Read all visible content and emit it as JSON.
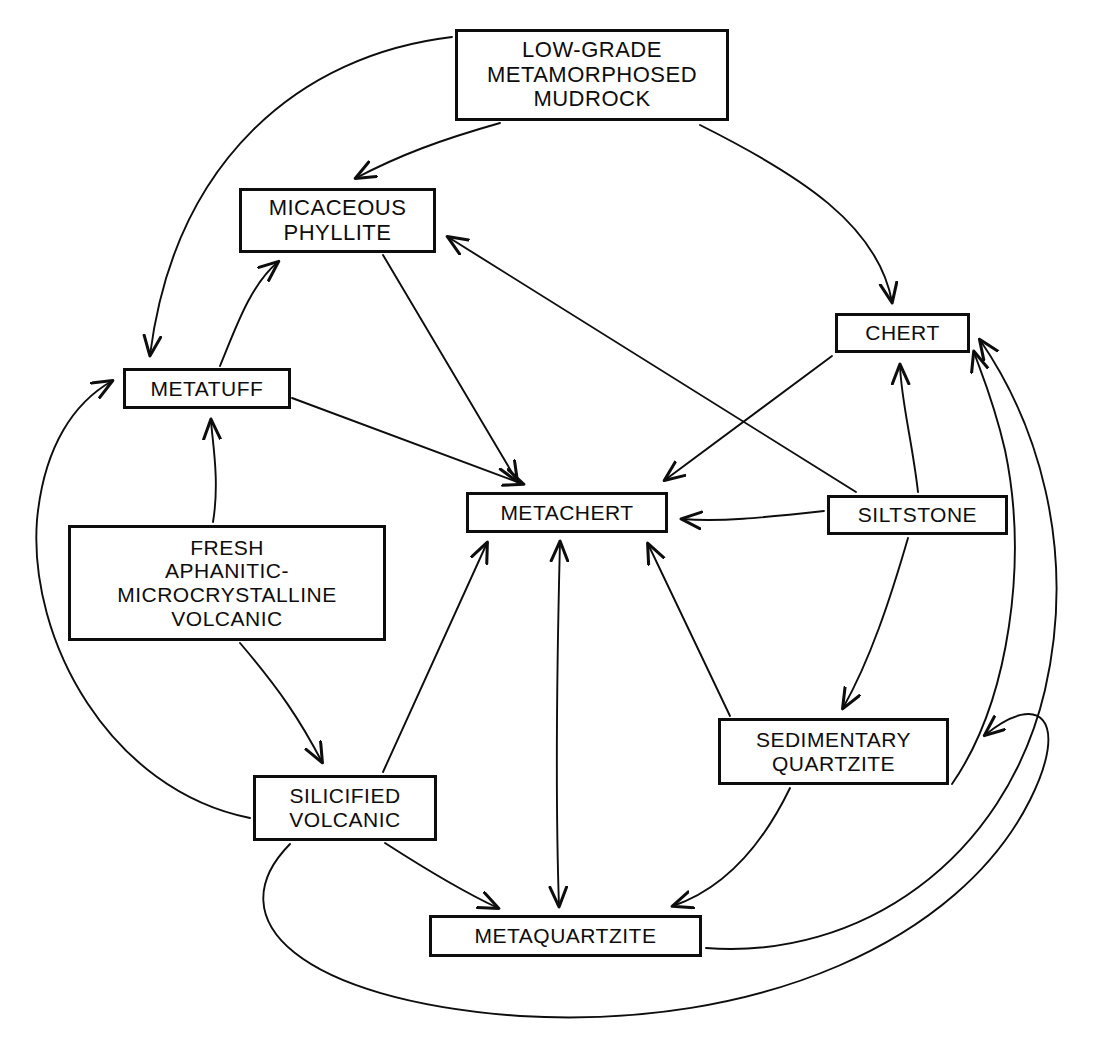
{
  "diagram": {
    "background_color": "#ffffff",
    "line_color": "#0d0d0d",
    "nodes": [
      {
        "id": "low_grade",
        "label": "LOW-GRADE\nMETAMORPHOSED\nMUDROCK",
        "x": 455,
        "y": 29,
        "w": 274,
        "h": 92
      },
      {
        "id": "micaceous",
        "label": "MICACEOUS\nPHYLLITE",
        "x": 239,
        "y": 188,
        "w": 197,
        "h": 65
      },
      {
        "id": "chert",
        "label": "CHERT",
        "x": 835,
        "y": 313,
        "w": 135,
        "h": 40
      },
      {
        "id": "metatuff",
        "label": "METATUFF",
        "x": 123,
        "y": 368,
        "w": 168,
        "h": 41
      },
      {
        "id": "metachert",
        "label": "METACHERT",
        "x": 466,
        "y": 492,
        "w": 202,
        "h": 41
      },
      {
        "id": "siltstone",
        "label": "SILTSTONE",
        "x": 827,
        "y": 495,
        "w": 181,
        "h": 40
      },
      {
        "id": "fresh",
        "label": "FRESH\nAPHANITIC-\nMICROCRYSTALLINE\nVOLCANIC",
        "x": 68,
        "y": 525,
        "w": 318,
        "h": 116
      },
      {
        "id": "sed_qtz",
        "label": "SEDIMENTARY\nQUARTZITE",
        "x": 718,
        "y": 718,
        "w": 231,
        "h": 67
      },
      {
        "id": "silicified",
        "label": "SILICIFIED\nVOLCANIC",
        "x": 253,
        "y": 775,
        "w": 184,
        "h": 66
      },
      {
        "id": "metaqtz",
        "label": "METAQUARTZITE",
        "x": 429,
        "y": 915,
        "w": 273,
        "h": 42
      }
    ],
    "edges": [
      {
        "from": "low_grade",
        "to": "metatuff",
        "style": "curve"
      },
      {
        "from": "low_grade",
        "to": "micaceous",
        "style": "curve"
      },
      {
        "from": "low_grade",
        "to": "chert",
        "style": "curve"
      },
      {
        "from": "metatuff",
        "to": "micaceous",
        "style": "curve"
      },
      {
        "from": "metatuff",
        "to": "metachert",
        "style": "line"
      },
      {
        "from": "micaceous",
        "to": "metachert",
        "style": "line"
      },
      {
        "from": "siltstone",
        "to": "micaceous",
        "style": "line"
      },
      {
        "from": "siltstone",
        "to": "metachert",
        "style": "line"
      },
      {
        "from": "siltstone",
        "to": "chert",
        "style": "curve"
      },
      {
        "from": "siltstone",
        "to": "sed_qtz",
        "style": "line"
      },
      {
        "from": "chert",
        "to": "metachert",
        "style": "line"
      },
      {
        "from": "fresh",
        "to": "metatuff",
        "style": "curve"
      },
      {
        "from": "fresh",
        "to": "silicified",
        "style": "curve"
      },
      {
        "from": "silicified",
        "to": "metatuff",
        "style": "curve"
      },
      {
        "from": "silicified",
        "to": "metachert",
        "style": "line"
      },
      {
        "from": "silicified",
        "to": "metaqtz",
        "style": "curve"
      },
      {
        "from": "silicified",
        "to": "sed_qtz",
        "style": "long-arc"
      },
      {
        "from": "sed_qtz",
        "to": "metachert",
        "style": "line"
      },
      {
        "from": "sed_qtz",
        "to": "metaqtz",
        "style": "curve"
      },
      {
        "from": "metachert",
        "to": "metaqtz",
        "style": "bidirectional"
      },
      {
        "from": "metaqtz",
        "to": "chert",
        "style": "long-arc"
      },
      {
        "from": "sed_qtz",
        "to": "chert",
        "style": "long-arc"
      }
    ]
  }
}
